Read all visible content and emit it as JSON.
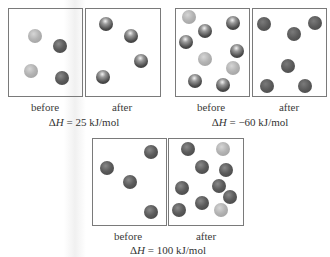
{
  "panels": [
    {
      "id": "panel-1",
      "delta_h_symbol": "Δ",
      "delta_h_var": "H",
      "delta_h_value": " = 25 kJ/mol",
      "before_label": "before",
      "after_label": "after",
      "before_box": {
        "x": 8,
        "y": 8,
        "w": 75,
        "h": 89
      },
      "after_box": {
        "x": 85,
        "y": 8,
        "w": 76,
        "h": 89
      },
      "before_spheres": [
        {
          "x": 35,
          "y": 36,
          "type": "light"
        },
        {
          "x": 60,
          "y": 46,
          "type": "dark"
        },
        {
          "x": 31,
          "y": 71,
          "type": "light"
        },
        {
          "x": 62,
          "y": 78,
          "type": "dark"
        }
      ],
      "after_spheres": [
        {
          "x": 106,
          "y": 24,
          "type": "shiny"
        },
        {
          "x": 131,
          "y": 36,
          "type": "shiny"
        },
        {
          "x": 141,
          "y": 61,
          "type": "shiny"
        },
        {
          "x": 103,
          "y": 77,
          "type": "shiny"
        }
      ],
      "before_label_pos": {
        "x": 45,
        "y": 101
      },
      "after_label_pos": {
        "x": 122,
        "y": 101
      },
      "delta_h_pos": {
        "x": 84,
        "y": 116
      }
    },
    {
      "id": "panel-2",
      "delta_h_symbol": "Δ",
      "delta_h_var": "H",
      "delta_h_value": " = −60 kJ/mol",
      "before_label": "before",
      "after_label": "after",
      "before_box": {
        "x": 175,
        "y": 8,
        "w": 75,
        "h": 89
      },
      "after_box": {
        "x": 252,
        "y": 8,
        "w": 75,
        "h": 89
      },
      "before_spheres": [
        {
          "x": 189,
          "y": 17,
          "type": "light"
        },
        {
          "x": 205,
          "y": 31,
          "type": "shiny"
        },
        {
          "x": 233,
          "y": 23,
          "type": "shiny"
        },
        {
          "x": 186,
          "y": 42,
          "type": "shiny"
        },
        {
          "x": 237,
          "y": 51,
          "type": "shiny"
        },
        {
          "x": 205,
          "y": 59,
          "type": "light"
        },
        {
          "x": 233,
          "y": 68,
          "type": "light"
        },
        {
          "x": 195,
          "y": 81,
          "type": "shiny"
        },
        {
          "x": 223,
          "y": 85,
          "type": "shiny"
        }
      ],
      "after_spheres": [
        {
          "x": 264,
          "y": 24,
          "type": "matte"
        },
        {
          "x": 315,
          "y": 23,
          "type": "matte"
        },
        {
          "x": 294,
          "y": 34,
          "type": "matte"
        },
        {
          "x": 288,
          "y": 66,
          "type": "matte"
        },
        {
          "x": 267,
          "y": 86,
          "type": "matte"
        },
        {
          "x": 305,
          "y": 86,
          "type": "matte"
        }
      ],
      "before_label_pos": {
        "x": 211,
        "y": 101
      },
      "after_label_pos": {
        "x": 289,
        "y": 101
      },
      "delta_h_pos": {
        "x": 250,
        "y": 116
      }
    },
    {
      "id": "panel-3",
      "delta_h_symbol": "Δ",
      "delta_h_var": "H",
      "delta_h_value": " = 100 kJ/mol",
      "before_label": "before",
      "after_label": "after",
      "before_box": {
        "x": 92,
        "y": 138,
        "w": 75,
        "h": 88
      },
      "after_box": {
        "x": 168,
        "y": 138,
        "w": 76,
        "h": 88
      },
      "before_spheres": [
        {
          "x": 151,
          "y": 152,
          "type": "dark"
        },
        {
          "x": 107,
          "y": 168,
          "type": "dark"
        },
        {
          "x": 130,
          "y": 182,
          "type": "dark"
        },
        {
          "x": 151,
          "y": 212,
          "type": "dark"
        }
      ],
      "after_spheres": [
        {
          "x": 188,
          "y": 149,
          "type": "dark"
        },
        {
          "x": 223,
          "y": 149,
          "type": "light"
        },
        {
          "x": 202,
          "y": 167,
          "type": "dark"
        },
        {
          "x": 226,
          "y": 170,
          "type": "dark"
        },
        {
          "x": 182,
          "y": 188,
          "type": "dark"
        },
        {
          "x": 219,
          "y": 186,
          "type": "dark"
        },
        {
          "x": 230,
          "y": 197,
          "type": "dark"
        },
        {
          "x": 202,
          "y": 203,
          "type": "dark"
        },
        {
          "x": 179,
          "y": 210,
          "type": "dark"
        },
        {
          "x": 221,
          "y": 210,
          "type": "light"
        }
      ],
      "before_label_pos": {
        "x": 128,
        "y": 230
      },
      "after_label_pos": {
        "x": 206,
        "y": 230
      },
      "delta_h_pos": {
        "x": 168,
        "y": 244
      }
    }
  ],
  "colors": {
    "box_border": "#7a7a7a",
    "text": "#333333",
    "background": "#ffffff"
  }
}
